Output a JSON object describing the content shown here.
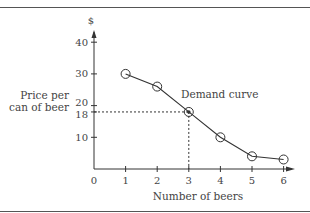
{
  "chart_data": {
    "type": "line",
    "title": "",
    "xlabel": "Number of beers",
    "ylabel": "Price per can of beer",
    "ylabel_lines": [
      "Price per",
      "can of beer"
    ],
    "y_unit": "$",
    "x": [
      1,
      2,
      3,
      4,
      5,
      6
    ],
    "series": [
      {
        "name": "Demand curve",
        "values": [
          30,
          26,
          18,
          10,
          4,
          3
        ]
      }
    ],
    "x_ticks": [
      0,
      1,
      2,
      3,
      4,
      5,
      6
    ],
    "y_ticks": [
      10,
      18,
      20,
      30,
      40
    ],
    "xlim": [
      0,
      6.4
    ],
    "ylim": [
      0,
      43
    ],
    "grid": false,
    "legend": "none",
    "annotations": [
      {
        "text": "Demand curve",
        "near": [
          4,
          23
        ]
      },
      {
        "type": "dashed-guide",
        "point": [
          3,
          18
        ]
      }
    ]
  },
  "labels": {
    "y_unit": "$",
    "ylabel_line1": "Price per",
    "ylabel_line2": "can of beer",
    "xlabel": "Number of beers",
    "curve_label": "Demand curve",
    "origin": "0"
  },
  "colors": {
    "ink": "#333333",
    "rule": "#555555",
    "background": "#ffffff"
  }
}
